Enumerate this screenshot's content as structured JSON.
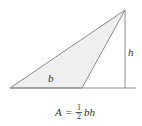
{
  "figure": {
    "colors": {
      "fill": "#efefef",
      "stroke": "#8a8a8a",
      "text": "#333333"
    },
    "geometry": {
      "left_vertex": [
        10,
        88
      ],
      "base_right_vertex": [
        82,
        88
      ],
      "apex": [
        125,
        10
      ],
      "baseline_end": [
        136,
        88
      ],
      "height_foot": [
        125,
        88
      ]
    },
    "labels": {
      "base": "b",
      "height": "h"
    }
  },
  "formula": {
    "lhs": "A",
    "equals": "=",
    "fraction_numerator": "1",
    "fraction_denominator": "2",
    "rhs_vars": "bh"
  }
}
